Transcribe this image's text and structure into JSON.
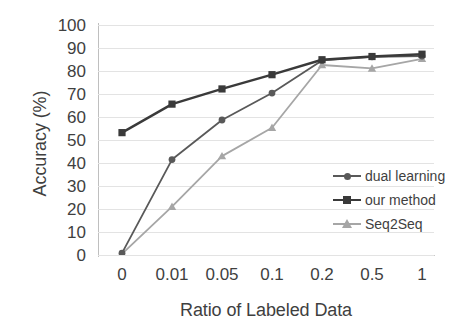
{
  "chart_data": {
    "type": "line",
    "title": "",
    "xlabel": "Ratio of Labeled Data",
    "ylabel": "Accuracy (%)",
    "categories": [
      "0",
      "0.01",
      "0.05",
      "0.1",
      "0.2",
      "0.5",
      "1"
    ],
    "x_tick_labels": [
      "0",
      "0.01",
      "0.05",
      "0.1",
      "0.2",
      "0.5",
      "1"
    ],
    "y_tick_labels": [
      "0",
      "10",
      "20",
      "30",
      "40",
      "50",
      "60",
      "70",
      "80",
      "90",
      "100"
    ],
    "ylim": [
      0,
      100
    ],
    "y_tick_step": 10,
    "grid": true,
    "grid_axis": "y",
    "legend_position": "inside-right",
    "series": [
      {
        "name": "dual learning",
        "color": "#595959",
        "marker": "circle",
        "values": [
          0.8,
          41.5,
          58.7,
          70.4,
          84.6,
          86.2,
          86.5
        ]
      },
      {
        "name": "our method",
        "color": "#3a3a3a",
        "marker": "square",
        "values": [
          53.2,
          65.6,
          72.2,
          78.4,
          84.9,
          86.3,
          87.3
        ]
      },
      {
        "name": "Seq2Seq",
        "color": "#a6a6a6",
        "marker": "triangle",
        "values": [
          0.5,
          21.0,
          43.0,
          55.3,
          82.6,
          81.1,
          85.3
        ]
      }
    ]
  },
  "axes": {
    "y_title": "Accuracy (%)",
    "x_title": "Ratio of Labeled Data"
  },
  "legend": {
    "items": [
      {
        "label": "dual learning",
        "color": "#595959",
        "marker": "circle"
      },
      {
        "label": "our method",
        "color": "#3a3a3a",
        "marker": "square"
      },
      {
        "label": "Seq2Seq",
        "color": "#a6a6a6",
        "marker": "triangle"
      }
    ]
  },
  "colors": {
    "grid": "#e3e3e3",
    "axis": "#c4c4c4",
    "text": "#3f3f3f",
    "background": "#ffffff"
  }
}
